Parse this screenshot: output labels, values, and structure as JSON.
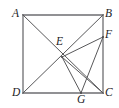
{
  "figure": {
    "type": "geometry-diagram",
    "shape": "square-with-cevians",
    "background_color": "#ffffff",
    "stroke_color": "#58585a",
    "label_color": "#1d1d1f",
    "width": 119,
    "height": 108,
    "points": [
      {
        "id": "A",
        "label": "A",
        "x": 23,
        "y": 15,
        "label_x": 12,
        "label_y": 8,
        "on": "square-corner-top-left"
      },
      {
        "id": "B",
        "label": "B",
        "x": 103,
        "y": 15,
        "label_x": 105,
        "label_y": 8,
        "on": "square-corner-top-right"
      },
      {
        "id": "C",
        "label": "C",
        "x": 103,
        "y": 93,
        "label_x": 105,
        "label_y": 87,
        "on": "square-corner-bottom-right"
      },
      {
        "id": "D",
        "label": "D",
        "x": 23,
        "y": 93,
        "label_x": 12,
        "label_y": 87,
        "on": "square-corner-bottom-left"
      },
      {
        "id": "E",
        "label": "E",
        "x": 62,
        "y": 57,
        "label_x": 56,
        "label_y": 36,
        "on": "interior-intersection"
      },
      {
        "id": "F",
        "label": "F",
        "x": 103,
        "y": 37,
        "label_x": 105,
        "label_y": 29,
        "on": "side-BC"
      },
      {
        "id": "G",
        "label": "G",
        "x": 81,
        "y": 93,
        "label_x": 77,
        "label_y": 94,
        "on": "side-DC"
      }
    ],
    "segments": [
      {
        "id": "AB",
        "from": "A",
        "to": "B",
        "kind": "square-side"
      },
      {
        "id": "BC",
        "from": "B",
        "to": "C",
        "kind": "square-side"
      },
      {
        "id": "CD",
        "from": "C",
        "to": "D",
        "kind": "square-side"
      },
      {
        "id": "DA",
        "from": "D",
        "to": "A",
        "kind": "square-side"
      },
      {
        "id": "AC",
        "from": "A",
        "to": "C",
        "kind": "diagonal"
      },
      {
        "id": "DB",
        "from": "D",
        "to": "B",
        "kind": "diagonal"
      },
      {
        "id": "EF",
        "from": "E",
        "to": "F",
        "kind": "cevian"
      },
      {
        "id": "EG",
        "from": "E",
        "to": "G",
        "kind": "cevian"
      },
      {
        "id": "EC",
        "from": "E",
        "to": "C",
        "kind": "cevian"
      },
      {
        "id": "FG",
        "from": "F",
        "to": "G",
        "kind": "cevian"
      }
    ]
  }
}
